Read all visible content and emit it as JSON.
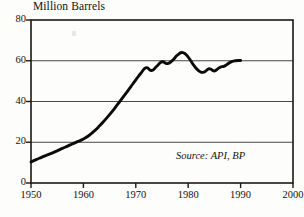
{
  "chart_data": {
    "type": "line",
    "title": "Million Barrels",
    "xlabel": "",
    "ylabel": "",
    "annotation": "Source: API, BP",
    "grid": true,
    "legend": "none",
    "xlim": [
      1950,
      2000
    ],
    "ylim": [
      0,
      80
    ],
    "xticks": [
      1950,
      1960,
      1970,
      1980,
      1990,
      2000
    ],
    "xtick_labels": [
      "1950",
      "1960",
      "1970",
      "1980",
      "1990",
      "2000"
    ],
    "yticks": [
      0,
      20,
      40,
      60,
      80
    ],
    "ytick_labels": [
      "0",
      "20",
      "40",
      "60",
      "80"
    ],
    "series": [
      {
        "name": "Crude oil stocks",
        "x": [
          1950,
          1951,
          1952,
          1953,
          1954,
          1955,
          1956,
          1957,
          1958,
          1959,
          1960,
          1961,
          1962,
          1963,
          1964,
          1965,
          1966,
          1967,
          1968,
          1969,
          1970,
          1971,
          1972,
          1973,
          1974,
          1975,
          1976,
          1977,
          1978,
          1979,
          1980,
          1981,
          1982,
          1983,
          1984,
          1985,
          1986,
          1987,
          1988,
          1989,
          1990
        ],
        "values": [
          10.3,
          11.5,
          12.6,
          13.7,
          14.7,
          15.8,
          17.0,
          18.1,
          19.3,
          20.4,
          21.6,
          23.2,
          25.3,
          27.8,
          30.6,
          33.6,
          36.8,
          40.2,
          43.6,
          47.1,
          50.6,
          54.0,
          56.6,
          55.2,
          57.3,
          59.5,
          58.6,
          60.2,
          62.9,
          64.0,
          61.8,
          58.0,
          55.1,
          54.4,
          56.1,
          55.0,
          56.7,
          57.5,
          59.2,
          60.0,
          60.1
        ]
      }
    ]
  },
  "axes": {
    "title_label": "Million Barrels",
    "source_label": "Source: API, BP"
  }
}
